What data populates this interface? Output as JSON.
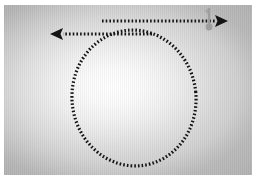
{
  "figure": {
    "plate": {
      "width": 252,
      "height": 174,
      "border_color": "#ffffff",
      "border_width": 2
    },
    "background": {
      "style": "radial-gradient",
      "center_color": "#ffffff",
      "edge_color": "#c0c0c0",
      "highlight_x_pct": 44,
      "highlight_y_pct": 48
    },
    "stroke": {
      "color": "#141414",
      "width": 3.2,
      "dash_pattern": "1.6 2.1",
      "linecap": "butt"
    },
    "circle": {
      "label": "dotted-circular-path",
      "center_x": 132,
      "center_y": 95,
      "radius_x": 62,
      "radius_y": 68,
      "rotation_deg": -6
    },
    "arrow_right": {
      "label": "arrow-pointing-right",
      "start_x": 100,
      "start_y": 18,
      "end_x": 226,
      "end_y": 18,
      "head_length": 13,
      "head_half_width": 6,
      "direction": "right"
    },
    "arrow_left": {
      "label": "arrow-pointing-left",
      "start_x": 150,
      "start_y": 31,
      "end_x": 48,
      "end_y": 31,
      "head_length": 13,
      "head_half_width": 6,
      "direction": "left"
    },
    "marker": {
      "label": "gray-pin-marker",
      "color": "#9e9e9e",
      "stem_x": 207,
      "stem_top_y": 5,
      "stem_bottom_y": 22,
      "stem_width": 2.4,
      "flag_color": "#a8a8a8",
      "dot_cx": 207,
      "dot_cy": 24,
      "dot_r": 3.4
    }
  }
}
